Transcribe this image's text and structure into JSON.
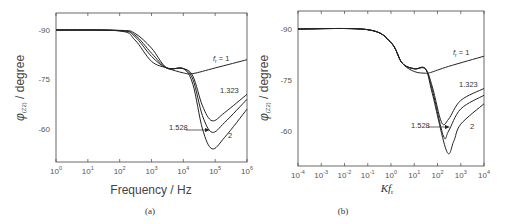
{
  "chart_data": [
    {
      "type": "line",
      "panel_caption": "(a)",
      "xlabel": "Frequency / Hz",
      "ylabel": "φ(Z2) / degree",
      "xscale": "log",
      "xlim": [
        1,
        1000000
      ],
      "ylim": [
        -95,
        -50
      ],
      "x_ticks": [
        "10^0",
        "10^1",
        "10^2",
        "10^3",
        "10^4",
        "10^5",
        "10^6"
      ],
      "y_ticks": [
        "-90",
        "-75",
        "-60"
      ],
      "annotations": [
        "f_r = 1",
        "1.323",
        "1.528",
        "2"
      ],
      "series": [
        {
          "name": "f_r = 1",
          "x": [
            1,
            100,
            300,
            1000,
            3000,
            10000,
            20000,
            100000,
            1000000
          ],
          "y": [
            -90,
            -89.7,
            -87,
            -80.5,
            -78.5,
            -77,
            -76.8,
            -78.5,
            -81
          ]
        },
        {
          "name": "1.323",
          "x": [
            1,
            100,
            300,
            1000,
            3000,
            10000,
            20000,
            40000,
            80000,
            200000,
            1000000
          ],
          "y": [
            -90,
            -89.8,
            -88,
            -82,
            -78.5,
            -78.3,
            -76,
            -67,
            -62.5,
            -65,
            -70.5
          ]
        },
        {
          "name": "1.528",
          "x": [
            1,
            100,
            300,
            1000,
            3000,
            10000,
            20000,
            40000,
            80000,
            200000,
            1000000
          ],
          "y": [
            -90,
            -89.8,
            -88.5,
            -83,
            -78.5,
            -78.3,
            -75,
            -64,
            -59,
            -62,
            -69
          ]
        },
        {
          "name": "2",
          "x": [
            1,
            100,
            300,
            1000,
            3000,
            10000,
            20000,
            40000,
            80000,
            200000,
            1000000
          ],
          "y": [
            -90,
            -89.9,
            -89,
            -84.5,
            -78.5,
            -78.3,
            -73.5,
            -60,
            -54,
            -57.5,
            -66
          ]
        }
      ]
    },
    {
      "type": "line",
      "panel_caption": "(b)",
      "xlabel": "Kf_r",
      "ylabel": "φ(Z2) / degree",
      "xscale": "log",
      "xlim": [
        0.0001,
        10000
      ],
      "ylim": [
        -95,
        -50
      ],
      "x_ticks": [
        "10^-4",
        "10^-3",
        "10^-2",
        "10^-1",
        "10^0",
        "10^1",
        "10^2",
        "10^3",
        "10^4"
      ],
      "y_ticks": [
        "-90",
        "-75",
        "-60"
      ],
      "annotations": [
        "f_r = 1",
        "1.323",
        "1.528",
        "2"
      ],
      "series": [
        {
          "name": "f_r = 1",
          "x": [
            0.0001,
            0.1,
            1,
            3,
            10,
            30,
            50,
            300,
            10000
          ],
          "y": [
            -90,
            -89.8,
            -86,
            -80,
            -77.5,
            -77,
            -77.2,
            -79,
            -82
          ]
        },
        {
          "name": "1.323",
          "x": [
            0.0001,
            0.1,
            1,
            3,
            10,
            30,
            60,
            150,
            300,
            1000,
            10000
          ],
          "y": [
            -90,
            -89.8,
            -86,
            -80,
            -78.3,
            -78.3,
            -73,
            -62.5,
            -63.5,
            -69,
            -72.5
          ]
        },
        {
          "name": "1.528",
          "x": [
            0.0001,
            0.1,
            1,
            3,
            10,
            30,
            60,
            180,
            300,
            1000,
            10000
          ],
          "y": [
            -90,
            -89.8,
            -86,
            -80,
            -78.3,
            -78.3,
            -72,
            -58.5,
            -60,
            -66.5,
            -70.5
          ]
        },
        {
          "name": "2",
          "x": [
            0.0001,
            0.1,
            1,
            3,
            10,
            30,
            60,
            250,
            500,
            1000,
            10000
          ],
          "y": [
            -90,
            -89.8,
            -86,
            -80,
            -78.3,
            -78.3,
            -71,
            -54,
            -57,
            -62,
            -68
          ]
        }
      ]
    }
  ],
  "labels": {
    "a": {
      "caption": "(a)",
      "xlabel": "Frequency / Hz",
      "ylabel_main": "φ",
      "ylabel_sub": "(Z2)",
      "ylabel_rest": " / degree",
      "ann_fr": "f",
      "ann_fr_sub": "r",
      "ann_fr_rest": " = 1",
      "ann_1323": "1.323",
      "ann_1528": "1.528",
      "ann_2": "2",
      "yt": [
        "-90",
        "-75",
        "-60"
      ],
      "xt": [
        [
          "10",
          "0"
        ],
        [
          "10",
          "1"
        ],
        [
          "10",
          "2"
        ],
        [
          "10",
          "3"
        ],
        [
          "10",
          "4"
        ],
        [
          "10",
          "5"
        ],
        [
          "10",
          "6"
        ]
      ]
    },
    "b": {
      "caption": "(b)",
      "xlabel_main": "Kf",
      "xlabel_sub": "r",
      "ylabel_main": "φ",
      "ylabel_sub": "(Z2)",
      "ylabel_rest": " / degree",
      "ann_fr": "f",
      "ann_fr_sub": "r",
      "ann_fr_rest": " = 1",
      "ann_1323": "1.323",
      "ann_1528": "1.528",
      "ann_2": "2",
      "yt": [
        "-90",
        "-75",
        "-60"
      ],
      "xt": [
        [
          "10",
          "-4"
        ],
        [
          "10",
          "-3"
        ],
        [
          "10",
          "-2"
        ],
        [
          "10",
          "-1"
        ],
        [
          "10",
          "0"
        ],
        [
          "10",
          "1"
        ],
        [
          "10",
          "2"
        ],
        [
          "10",
          "3"
        ],
        [
          "10",
          "4"
        ]
      ]
    }
  }
}
